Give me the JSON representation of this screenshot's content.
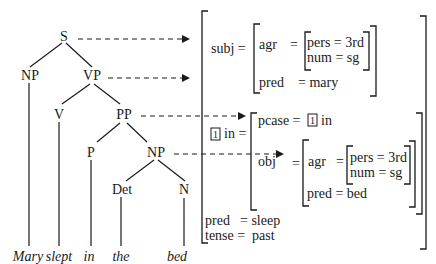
{
  "tree": {
    "nodes": {
      "S": "S",
      "NP1": "NP",
      "VP": "VP",
      "V": "V",
      "PP": "PP",
      "P": "P",
      "NP2": "NP",
      "Det": "Det",
      "N": "N"
    },
    "words": [
      "Mary",
      "slept",
      "in",
      "the",
      "bed"
    ]
  },
  "fstructure": {
    "subj_label": "subj =",
    "subj": {
      "agr_label": "agr",
      "eq": "=",
      "pers": "pers = 3rd",
      "num": "num = sg",
      "pred": "pred",
      "pred_eq": "= mary"
    },
    "in_index": "1",
    "in_label": "in =",
    "in": {
      "pcase_label": "pcase =",
      "pcase_index": "1",
      "pcase_value": "in",
      "obj_label": "obj",
      "obj_eq": "=",
      "obj": {
        "agr_label": "agr",
        "eq": "=",
        "pers": "pers = 3rd",
        "num": "num = sg",
        "pred": "pred = bed"
      }
    },
    "pred_label": "pred",
    "pred_value": "=  sleep",
    "tense_label": "tense =",
    "tense_value": "past"
  }
}
